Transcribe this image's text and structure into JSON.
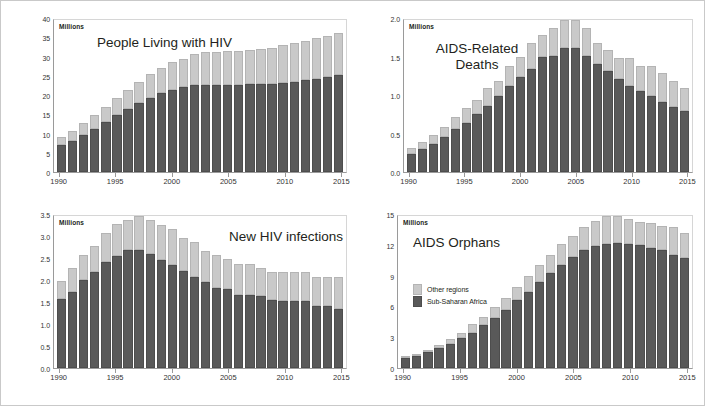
{
  "figure": {
    "units_label": "Millions",
    "legend": {
      "other_regions": "Other regions",
      "sub_saharan_africa": "Sub-Saharan Africa"
    },
    "colors": {
      "other_regions": "#c9c9c9",
      "sub_saharan_africa": "#595959",
      "axis": "#9a9a9a",
      "frame": "#c9c9c9",
      "text": "#231f20"
    }
  },
  "chart_data": [
    {
      "id": "people-living-with-hiv",
      "type": "bar",
      "stacked": true,
      "title": "People Living with HIV",
      "xlabel": "",
      "ylabel": "Millions",
      "ylim": [
        0,
        40
      ],
      "yticks": [
        0,
        5,
        10,
        15,
        20,
        25,
        30,
        35,
        40
      ],
      "ytick_labels": [
        "0",
        "5",
        "10",
        "15",
        "20",
        "25",
        "30",
        "35",
        "40"
      ],
      "grid": false,
      "legend_position": "none",
      "categories": [
        1990,
        1991,
        1992,
        1993,
        1994,
        1995,
        1996,
        1997,
        1998,
        1999,
        2000,
        2001,
        2002,
        2003,
        2004,
        2005,
        2006,
        2007,
        2008,
        2009,
        2010,
        2011,
        2012,
        2013,
        2014,
        2015
      ],
      "xtick_labels": [
        "1990",
        "1995",
        "2000",
        "2005",
        "2010",
        "2015"
      ],
      "series": [
        {
          "name": "Sub-Saharan Africa",
          "values": [
            7.0,
            8.2,
            9.7,
            11.3,
            13.1,
            14.9,
            16.5,
            18.1,
            19.6,
            20.8,
            21.6,
            22.3,
            22.8,
            23.0,
            23.0,
            23.0,
            23.0,
            23.1,
            23.1,
            23.2,
            23.5,
            23.8,
            24.1,
            24.6,
            25.1,
            25.5
          ]
        },
        {
          "name": "Other regions",
          "values": [
            2.1,
            2.6,
            3.2,
            3.6,
            4.1,
            4.5,
            5.1,
            5.7,
            6.3,
            6.6,
            7.3,
            7.5,
            8.3,
            8.5,
            8.7,
            8.8,
            8.8,
            9.0,
            9.3,
            9.5,
            9.8,
            10.1,
            10.4,
            10.6,
            10.7,
            11.1
          ]
        }
      ],
      "totals": [
        9.1,
        10.8,
        12.9,
        14.9,
        17.2,
        19.4,
        21.6,
        23.8,
        25.9,
        27.4,
        28.9,
        29.8,
        31.1,
        31.5,
        31.7,
        31.8,
        31.8,
        32.1,
        32.4,
        32.7,
        33.3,
        33.9,
        34.5,
        35.2,
        35.8,
        36.6
      ]
    },
    {
      "id": "aids-related-deaths",
      "type": "bar",
      "stacked": true,
      "title": "AIDS-Related\nDeaths",
      "xlabel": "",
      "ylabel": "Millions",
      "ylim": [
        0,
        2.0
      ],
      "yticks": [
        0,
        0.5,
        1.0,
        1.5,
        2.0
      ],
      "ytick_labels": [
        "0.0",
        "0.5",
        "1.0",
        "1.5",
        "2.0"
      ],
      "grid": false,
      "legend_position": "none",
      "categories": [
        1990,
        1991,
        1992,
        1993,
        1994,
        1995,
        1996,
        1997,
        1998,
        1999,
        2000,
        2001,
        2002,
        2003,
        2004,
        2005,
        2006,
        2007,
        2008,
        2009,
        2010,
        2011,
        2012,
        2013,
        2014,
        2015
      ],
      "xtick_labels": [
        "1990",
        "1995",
        "2000",
        "2005",
        "2010",
        "2015"
      ],
      "series": [
        {
          "name": "Sub-Saharan Africa",
          "values": [
            0.24,
            0.3,
            0.37,
            0.46,
            0.56,
            0.65,
            0.76,
            0.87,
            1.0,
            1.13,
            1.25,
            1.36,
            1.51,
            1.52,
            1.63,
            1.63,
            1.52,
            1.42,
            1.33,
            1.23,
            1.13,
            1.06,
            1.0,
            0.92,
            0.85,
            0.8
          ]
        },
        {
          "name": "Other regions",
          "values": [
            0.07,
            0.1,
            0.12,
            0.13,
            0.16,
            0.19,
            0.19,
            0.23,
            0.2,
            0.27,
            0.26,
            0.34,
            0.29,
            0.38,
            0.37,
            0.37,
            0.38,
            0.28,
            0.27,
            0.27,
            0.37,
            0.34,
            0.4,
            0.38,
            0.35,
            0.3
          ]
        }
      ],
      "totals": [
        0.31,
        0.4,
        0.49,
        0.59,
        0.72,
        0.84,
        0.95,
        1.1,
        1.2,
        1.4,
        1.51,
        1.7,
        1.8,
        1.9,
        2.0,
        2.0,
        1.9,
        1.7,
        1.6,
        1.5,
        1.5,
        1.4,
        1.4,
        1.3,
        1.2,
        1.1
      ]
    },
    {
      "id": "new-hiv-infections",
      "type": "bar",
      "stacked": true,
      "title": "New HIV infections",
      "xlabel": "",
      "ylabel": "Millions",
      "ylim": [
        0,
        3.5
      ],
      "yticks": [
        0,
        0.5,
        1.0,
        1.5,
        2.0,
        2.5,
        3.0,
        3.5
      ],
      "ytick_labels": [
        "0.0",
        "0.5",
        "1.0",
        "1.5",
        "2.0",
        "2.5",
        "3.0",
        "3.5"
      ],
      "grid": false,
      "legend_position": "none",
      "categories": [
        1990,
        1991,
        1992,
        1993,
        1994,
        1995,
        1996,
        1997,
        1998,
        1999,
        2000,
        2001,
        2002,
        2003,
        2004,
        2005,
        2006,
        2007,
        2008,
        2009,
        2010,
        2011,
        2012,
        2013,
        2014,
        2015
      ],
      "xtick_labels": [
        "1990",
        "1995",
        "2000",
        "2005",
        "2010",
        "2015"
      ],
      "series": [
        {
          "name": "Sub-Saharan Africa",
          "values": [
            1.6,
            1.75,
            2.03,
            2.2,
            2.45,
            2.59,
            2.71,
            2.72,
            2.62,
            2.49,
            2.37,
            2.24,
            2.1,
            1.99,
            1.85,
            1.82,
            1.69,
            1.68,
            1.66,
            1.57,
            1.55,
            1.54,
            1.54,
            1.43,
            1.42,
            1.37
          ]
        },
        {
          "name": "Other regions",
          "values": [
            0.4,
            0.55,
            0.57,
            0.6,
            0.65,
            0.72,
            0.69,
            0.78,
            0.78,
            0.81,
            0.83,
            0.76,
            0.8,
            0.71,
            0.75,
            0.68,
            0.71,
            0.72,
            0.64,
            0.63,
            0.65,
            0.66,
            0.66,
            0.67,
            0.68,
            0.73
          ]
        }
      ],
      "totals": [
        2.0,
        2.3,
        2.6,
        2.8,
        3.1,
        3.31,
        3.4,
        3.5,
        3.4,
        3.3,
        3.2,
        3.0,
        2.9,
        2.7,
        2.6,
        2.5,
        2.4,
        2.4,
        2.3,
        2.2,
        2.2,
        2.2,
        2.2,
        2.1,
        2.1,
        2.1
      ]
    },
    {
      "id": "aids-orphans",
      "type": "bar",
      "stacked": true,
      "title": "AIDS Orphans",
      "xlabel": "",
      "ylabel": "Millions",
      "ylim": [
        0,
        15
      ],
      "yticks": [
        0,
        3,
        6,
        9,
        12,
        15
      ],
      "ytick_labels": [
        "0",
        "3",
        "6",
        "9",
        "12",
        "15"
      ],
      "grid": false,
      "legend_position": "inside-upper-left",
      "legend_entries": [
        "Other regions",
        "Sub-Saharan Africa"
      ],
      "categories": [
        1990,
        1991,
        1992,
        1993,
        1994,
        1995,
        1996,
        1997,
        1998,
        1999,
        2000,
        2001,
        2002,
        2003,
        2004,
        2005,
        2006,
        2007,
        2008,
        2009,
        2010,
        2011,
        2012,
        2013,
        2014,
        2015
      ],
      "xtick_labels": [
        "1990",
        "1995",
        "2000",
        "2005",
        "2010",
        "2015"
      ],
      "series": [
        {
          "name": "Sub-Saharan Africa",
          "values": [
            0.95,
            1.15,
            1.55,
            1.95,
            2.4,
            2.95,
            3.5,
            4.2,
            4.9,
            5.7,
            6.7,
            7.5,
            8.5,
            9.35,
            10.15,
            11.0,
            11.6,
            12.0,
            12.2,
            12.3,
            12.2,
            12.1,
            11.85,
            11.6,
            11.2,
            10.9
          ]
        },
        {
          "name": "Other regions",
          "values": [
            0.15,
            0.25,
            0.25,
            0.3,
            0.45,
            0.55,
            0.8,
            0.8,
            1.1,
            1.2,
            1.3,
            1.6,
            1.7,
            1.85,
            2.1,
            2.0,
            2.3,
            2.5,
            2.8,
            2.7,
            2.5,
            2.35,
            2.5,
            2.45,
            2.7,
            2.4
          ]
        }
      ],
      "totals": [
        1.1,
        1.4,
        1.8,
        2.25,
        2.85,
        3.5,
        4.3,
        5.0,
        6.0,
        6.9,
        8.0,
        9.1,
        10.2,
        11.2,
        12.25,
        13.0,
        13.9,
        14.5,
        15.0,
        15.0,
        14.7,
        14.45,
        14.35,
        14.05,
        13.9,
        13.3
      ]
    }
  ]
}
